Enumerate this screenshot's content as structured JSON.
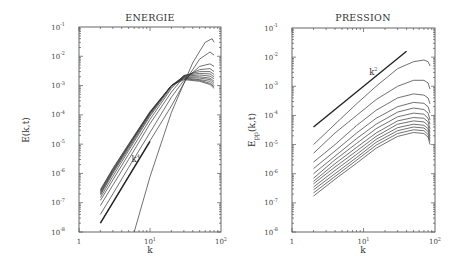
{
  "chart_data": [
    {
      "type": "line",
      "title": "ENERGIE",
      "xlabel": "k",
      "ylabel": "E(k,t)",
      "xscale": "log",
      "yscale": "log",
      "xlim": [
        1,
        100
      ],
      "ylim": [
        1e-08,
        0.1
      ],
      "x_ticks": [
        {
          "base": "1",
          "exp": ""
        },
        {
          "base": "10",
          "exp": "1"
        },
        {
          "base": "10",
          "exp": "2"
        }
      ],
      "y_ticks": [
        {
          "base": "10",
          "exp": "-1"
        },
        {
          "base": "10",
          "exp": "-2"
        },
        {
          "base": "10",
          "exp": "-3"
        },
        {
          "base": "10",
          "exp": "-4"
        },
        {
          "base": "10",
          "exp": "-5"
        },
        {
          "base": "10",
          "exp": "-6"
        },
        {
          "base": "10",
          "exp": "-7"
        },
        {
          "base": "10",
          "exp": "-8"
        }
      ],
      "annotation": {
        "base": "k",
        "exp": "4",
        "x": 5.5,
        "y": 2.5e-06
      },
      "reference_line": {
        "label": "k^4",
        "x": [
          2,
          10
        ],
        "y": [
          2e-08,
          1.25e-05
        ]
      },
      "series": [
        {
          "name": "t0",
          "x": [
            6,
            10,
            20,
            40,
            60,
            75,
            80
          ],
          "y": [
            1e-08,
            7.7e-07,
            0.00012,
            0.006,
            0.03,
            0.04,
            0.03
          ]
        },
        {
          "name": "t1",
          "x": [
            2,
            3,
            5,
            10,
            20,
            30,
            50,
            70,
            80
          ],
          "y": [
            2e-08,
            1e-07,
            8e-07,
            1.3e-05,
            0.0002,
            0.0012,
            0.008,
            0.014,
            0.011
          ]
        },
        {
          "name": "t2",
          "x": [
            2,
            3,
            5,
            10,
            20,
            30,
            50,
            70,
            80
          ],
          "y": [
            4e-08,
            2e-07,
            1.6e-06,
            2.5e-05,
            0.0004,
            0.0015,
            0.0045,
            0.0055,
            0.0045
          ]
        },
        {
          "name": "t3",
          "x": [
            2,
            3,
            5,
            10,
            20,
            30,
            50,
            70,
            80
          ],
          "y": [
            8e-08,
            4e-07,
            3e-06,
            5e-05,
            0.0006,
            0.002,
            0.0035,
            0.0038,
            0.003
          ]
        },
        {
          "name": "t4",
          "x": [
            2,
            3,
            5,
            10,
            20,
            30,
            50,
            70,
            80
          ],
          "y": [
            1.2e-07,
            6e-07,
            4.5e-06,
            7e-05,
            0.0008,
            0.0022,
            0.003,
            0.003,
            0.0024
          ]
        },
        {
          "name": "t5",
          "x": [
            2,
            3,
            5,
            10,
            20,
            30,
            50,
            70,
            80
          ],
          "y": [
            1.5e-07,
            8e-07,
            6e-06,
            9e-05,
            0.0009,
            0.0022,
            0.0026,
            0.0025,
            0.002
          ]
        },
        {
          "name": "t6",
          "x": [
            2,
            3,
            5,
            10,
            20,
            30,
            50,
            70,
            80
          ],
          "y": [
            1.8e-07,
            1e-06,
            7e-06,
            0.0001,
            0.001,
            0.0021,
            0.0023,
            0.0021,
            0.0017
          ]
        },
        {
          "name": "t7",
          "x": [
            2,
            3,
            5,
            10,
            20,
            30,
            50,
            70,
            80
          ],
          "y": [
            2e-07,
            1.1e-06,
            8e-06,
            0.00011,
            0.001,
            0.002,
            0.002,
            0.0018,
            0.0014
          ]
        },
        {
          "name": "t8",
          "x": [
            2,
            3,
            5,
            10,
            20,
            30,
            50,
            70,
            80
          ],
          "y": [
            2.2e-07,
            1.2e-06,
            8.5e-06,
            0.000115,
            0.001,
            0.0019,
            0.0018,
            0.0016,
            0.0012
          ]
        },
        {
          "name": "t9",
          "x": [
            2,
            3,
            5,
            10,
            20,
            30,
            50,
            70,
            80
          ],
          "y": [
            2.4e-07,
            1.3e-06,
            9e-06,
            0.00012,
            0.001,
            0.0018,
            0.0016,
            0.0014,
            0.001
          ]
        },
        {
          "name": "t10",
          "x": [
            2,
            3,
            5,
            10,
            20,
            30,
            50,
            70,
            80
          ],
          "y": [
            2.6e-07,
            1.4e-06,
            9.5e-06,
            0.000125,
            0.001,
            0.0017,
            0.0015,
            0.0012,
            0.0009
          ]
        },
        {
          "name": "t11",
          "x": [
            2,
            3,
            5,
            10,
            20,
            30,
            50,
            70,
            80
          ],
          "y": [
            2.8e-07,
            1.5e-06,
            1e-05,
            0.00013,
            0.001,
            0.0016,
            0.0014,
            0.0011,
            0.0008
          ]
        }
      ]
    },
    {
      "type": "line",
      "title": "PRESSION",
      "xlabel": "k",
      "ylabel": "E_pp(k,t)",
      "xscale": "log",
      "yscale": "log",
      "xlim": [
        1,
        100
      ],
      "ylim": [
        1e-08,
        0.1
      ],
      "x_ticks": [
        {
          "base": "1",
          "exp": ""
        },
        {
          "base": "10",
          "exp": "1"
        },
        {
          "base": "10",
          "exp": "2"
        }
      ],
      "y_ticks": [
        {
          "base": "10",
          "exp": "-1"
        },
        {
          "base": "10",
          "exp": "-2"
        },
        {
          "base": "10",
          "exp": "-3"
        },
        {
          "base": "10",
          "exp": "-4"
        },
        {
          "base": "10",
          "exp": "-5"
        },
        {
          "base": "10",
          "exp": "-6"
        },
        {
          "base": "10",
          "exp": "-7"
        },
        {
          "base": "10",
          "exp": "-8"
        }
      ],
      "annotation": {
        "base": "k",
        "exp": "2",
        "x": 12,
        "y": 0.0025
      },
      "reference_line": {
        "label": "k^2",
        "x": [
          2,
          40
        ],
        "y": [
          4e-05,
          0.016
        ]
      },
      "series": [
        {
          "name": "t1",
          "x": [
            2,
            4,
            8,
            15,
            30,
            50,
            70,
            80,
            85
          ],
          "y": [
            1e-05,
            5e-05,
            0.00025,
            0.001,
            0.004,
            0.007,
            0.008,
            0.007,
            0.005
          ]
        },
        {
          "name": "t2",
          "x": [
            2,
            4,
            8,
            15,
            30,
            50,
            70,
            80,
            85
          ],
          "y": [
            5e-06,
            2.5e-05,
            0.0001,
            0.00035,
            0.001,
            0.0016,
            0.0016,
            0.0013,
            0.0008
          ]
        },
        {
          "name": "t3",
          "x": [
            2,
            4,
            8,
            15,
            30,
            50,
            70,
            80,
            85
          ],
          "y": [
            2.5e-06,
            1e-05,
            4.5e-05,
            0.00015,
            0.0004,
            0.00055,
            0.0005,
            0.0004,
            0.00025
          ]
        },
        {
          "name": "t4",
          "x": [
            2,
            4,
            8,
            15,
            30,
            50,
            70,
            80,
            85
          ],
          "y": [
            1.5e-06,
            6e-06,
            2.5e-05,
            8e-05,
            0.0002,
            0.00028,
            0.00026,
            0.0002,
            0.00012
          ]
        },
        {
          "name": "t5",
          "x": [
            2,
            4,
            8,
            15,
            30,
            50,
            70,
            80,
            85
          ],
          "y": [
            1e-06,
            4e-06,
            1.6e-05,
            5e-05,
            0.00013,
            0.00018,
            0.00016,
            0.00012,
            7e-05
          ]
        },
        {
          "name": "t6",
          "x": [
            2,
            4,
            8,
            15,
            30,
            50,
            70,
            80,
            85
          ],
          "y": [
            7e-07,
            3e-06,
            1.1e-05,
            3.5e-05,
            9e-05,
            0.00012,
            0.00011,
            8e-05,
            5e-05
          ]
        },
        {
          "name": "t7",
          "x": [
            2,
            4,
            8,
            15,
            30,
            50,
            70,
            80,
            85
          ],
          "y": [
            5.5e-07,
            2.2e-06,
            8e-06,
            2.5e-05,
            6.5e-05,
            8.5e-05,
            8e-05,
            6e-05,
            3.5e-05
          ]
        },
        {
          "name": "t8",
          "x": [
            2,
            4,
            8,
            15,
            30,
            50,
            70,
            80,
            85
          ],
          "y": [
            4.5e-07,
            1.7e-06,
            6e-06,
            1.9e-05,
            5e-05,
            6.5e-05,
            6e-05,
            4.5e-05,
            2.6e-05
          ]
        },
        {
          "name": "t9",
          "x": [
            2,
            4,
            8,
            15,
            30,
            50,
            70,
            80,
            85
          ],
          "y": [
            3.5e-07,
            1.3e-06,
            4.6e-06,
            1.5e-05,
            3.8e-05,
            5e-05,
            4.6e-05,
            3.5e-05,
            2e-05
          ]
        },
        {
          "name": "t10",
          "x": [
            2,
            4,
            8,
            15,
            30,
            50,
            70,
            80,
            85
          ],
          "y": [
            2.8e-07,
            1e-06,
            3.6e-06,
            1.2e-05,
            3e-05,
            4e-05,
            3.7e-05,
            2.8e-05,
            1.6e-05
          ]
        },
        {
          "name": "t11",
          "x": [
            2,
            4,
            8,
            15,
            30,
            50,
            70,
            80,
            85
          ],
          "y": [
            2.2e-07,
            8e-07,
            2.9e-06,
            9.5e-06,
            2.4e-05,
            3.2e-05,
            3e-05,
            2.2e-05,
            1.3e-05
          ]
        },
        {
          "name": "t12",
          "x": [
            2,
            4,
            8,
            15,
            30,
            50,
            70,
            80,
            85
          ],
          "y": [
            1.7e-07,
            6.5e-07,
            2.3e-06,
            7.5e-06,
            1.9e-05,
            2.6e-05,
            2.4e-05,
            1.8e-05,
            1e-05
          ]
        }
      ]
    }
  ]
}
